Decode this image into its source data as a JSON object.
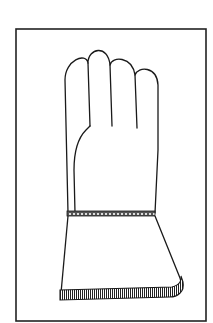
{
  "figure": {
    "stroke_color": "#1a1a1a",
    "background": "#ffffff",
    "frame": {
      "x": 15,
      "y": 28,
      "width": 191,
      "height": 293
    }
  }
}
